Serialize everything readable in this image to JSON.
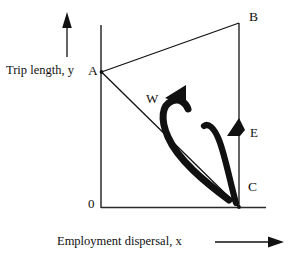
{
  "figure": {
    "type": "diagram",
    "background_color": "#ffffff",
    "line_color": "#111111",
    "axes": {
      "x_axis_label": "Employment dispersal, x",
      "y_axis_label": "Trip length, y",
      "origin_label": "0",
      "x_axis_arrow_icon": "arrow-right-icon",
      "y_axis_arrow_icon": "arrow-up-icon"
    },
    "points": [
      {
        "id": "A",
        "label": "A",
        "x": 101,
        "y": 72
      },
      {
        "id": "B",
        "label": "B",
        "x": 239,
        "y": 23
      },
      {
        "id": "C",
        "label": "C",
        "x": 239,
        "y": 207
      }
    ],
    "edges": [
      {
        "from": "A",
        "to": "B"
      },
      {
        "from": "B",
        "to": "C"
      },
      {
        "from": "A",
        "to": "C"
      }
    ],
    "trajectories": [
      {
        "id": "W",
        "label": "W",
        "description": "thick hooked curve rising from the A-C diagonal and curling up-left",
        "arrow_icon": "arrowhead-up-left-icon"
      },
      {
        "id": "E",
        "label": "E",
        "description": "thick hooked curve rising along the B-C vertical and curling up-left",
        "arrow_icon": "arrowhead-up-left-icon"
      }
    ]
  }
}
